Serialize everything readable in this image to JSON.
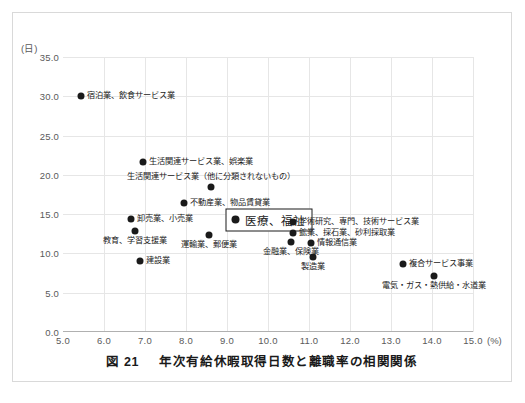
{
  "figure": {
    "caption_number": "図 21",
    "caption_title": "年次有給休暇取得日数と離職率の相関関係"
  },
  "chart_data": {
    "type": "scatter",
    "title": "年次有給休暇取得日数と離職率の相関関係",
    "xlabel": "(%)",
    "ylabel": "(日)",
    "xlim": [
      5.0,
      15.0
    ],
    "ylim": [
      0.0,
      35.0
    ],
    "grid": true,
    "legend": "none",
    "x_ticks": [
      "5.0",
      "6.0",
      "7.0",
      "8.0",
      "9.0",
      "10.0",
      "11.0",
      "12.0",
      "13.0",
      "14.0",
      "15.0"
    ],
    "x_unit": "(%)",
    "y_ticks": [
      "0.0",
      "5.0",
      "10.0",
      "15.0",
      "20.0",
      "25.0",
      "30.0",
      "35.0"
    ],
    "y_unit": "(日)",
    "point_color": "#1a1a1a",
    "grid_color": "#e6e6e6",
    "points": [
      {
        "label": "宿泊業、飲食サービス業",
        "x": 5.45,
        "y": 30.0,
        "label_pos": "right"
      },
      {
        "label": "生活関連サービス業、娯楽業",
        "x": 6.95,
        "y": 21.6,
        "label_pos": "right"
      },
      {
        "label": "生活関連サービス業（他に分類されないもの）",
        "x": 8.62,
        "y": 18.5,
        "label_pos": "above"
      },
      {
        "label": "不動産業、物品賃貸業",
        "x": 7.95,
        "y": 16.4,
        "label_pos": "right"
      },
      {
        "label": "卸売業、小売業",
        "x": 6.65,
        "y": 14.4,
        "label_pos": "right"
      },
      {
        "label": "教育、学習支援業",
        "x": 6.75,
        "y": 12.8,
        "label_pos": "below"
      },
      {
        "label": "医療、福祉",
        "x": 9.05,
        "y": 14.3,
        "label_pos": "highlight"
      },
      {
        "label": "学術研究、専門、技術サービス業",
        "x": 10.62,
        "y": 14.0,
        "label_pos": "right"
      },
      {
        "label": "鉱業、採石業、砂利採取業",
        "x": 10.62,
        "y": 12.6,
        "label_pos": "right"
      },
      {
        "label": "運輸業、郵便業",
        "x": 8.55,
        "y": 12.3,
        "label_pos": "below"
      },
      {
        "label": "金融業、保険業",
        "x": 10.55,
        "y": 11.4,
        "label_pos": "below"
      },
      {
        "label": "情報通信業",
        "x": 11.05,
        "y": 11.3,
        "label_pos": "right"
      },
      {
        "label": "製造業",
        "x": 11.1,
        "y": 9.6,
        "label_pos": "below"
      },
      {
        "label": "建設業",
        "x": 6.88,
        "y": 9.0,
        "label_pos": "right"
      },
      {
        "label": "複合サービス事業",
        "x": 13.3,
        "y": 8.7,
        "label_pos": "right"
      },
      {
        "label": "電気・ガス・熱供給・水道業",
        "x": 14.05,
        "y": 7.1,
        "label_pos": "below"
      }
    ]
  }
}
